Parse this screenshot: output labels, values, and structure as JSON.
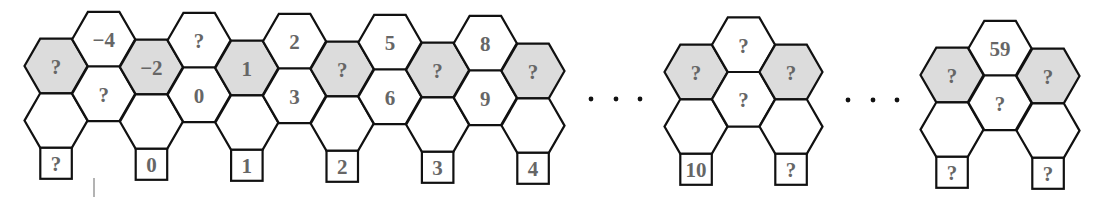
{
  "figure": {
    "colors": {
      "shaded_fill": "#dcdcdc",
      "plain_fill": "#ffffff",
      "stroke": "#111111",
      "label": "#666666"
    },
    "hex_radius": 31.5,
    "groups": [
      {
        "id": "group-1",
        "first_column_x": 56,
        "column_spacing": 47.7,
        "shaded_center_y_start": 66,
        "shaded_center_y_end": 71,
        "columns": [
          {
            "type": "shaded",
            "shaded_label": "?",
            "box_label": "?"
          },
          {
            "type": "raised",
            "top_label": "−4",
            "middle_label": "?"
          },
          {
            "type": "shaded",
            "shaded_label": "−2",
            "box_label": "0"
          },
          {
            "type": "raised",
            "top_label": "?",
            "middle_label": "0"
          },
          {
            "type": "shaded",
            "shaded_label": "1",
            "box_label": "1"
          },
          {
            "type": "raised",
            "top_label": "2",
            "middle_label": "3"
          },
          {
            "type": "shaded",
            "shaded_label": "?",
            "box_label": "2"
          },
          {
            "type": "raised",
            "top_label": "5",
            "middle_label": "6"
          },
          {
            "type": "shaded",
            "shaded_label": "?",
            "box_label": "3"
          },
          {
            "type": "raised",
            "top_label": "8",
            "middle_label": "9"
          },
          {
            "type": "shaded",
            "shaded_label": "?",
            "box_label": "4"
          }
        ]
      },
      {
        "id": "group-2",
        "first_column_x": 696,
        "column_spacing": 47.5,
        "shaded_center_y_start": 72,
        "shaded_center_y_end": 72,
        "columns": [
          {
            "type": "shaded",
            "shaded_label": "?",
            "box_label": "10"
          },
          {
            "type": "raised",
            "top_label": "?",
            "middle_label": "?"
          },
          {
            "type": "shaded",
            "shaded_label": "?",
            "box_label": "?"
          }
        ]
      },
      {
        "id": "group-3",
        "first_column_x": 952,
        "column_spacing": 48,
        "shaded_center_y_start": 75,
        "shaded_center_y_end": 76,
        "columns": [
          {
            "type": "shaded",
            "shaded_label": "?",
            "box_label": "?"
          },
          {
            "type": "raised",
            "top_label": "59",
            "middle_label": "?"
          },
          {
            "type": "shaded",
            "shaded_label": "?",
            "box_label": "?"
          }
        ]
      }
    ],
    "ellipses": [
      {
        "id": "ellipsis-1",
        "dots_x": [
          591,
          616,
          640
        ],
        "y": 99
      },
      {
        "id": "ellipsis-2",
        "dots_x": [
          848,
          873,
          897
        ],
        "y": 100
      }
    ],
    "stray_mark": {
      "x": 94,
      "y1": 178,
      "y2": 197
    }
  }
}
